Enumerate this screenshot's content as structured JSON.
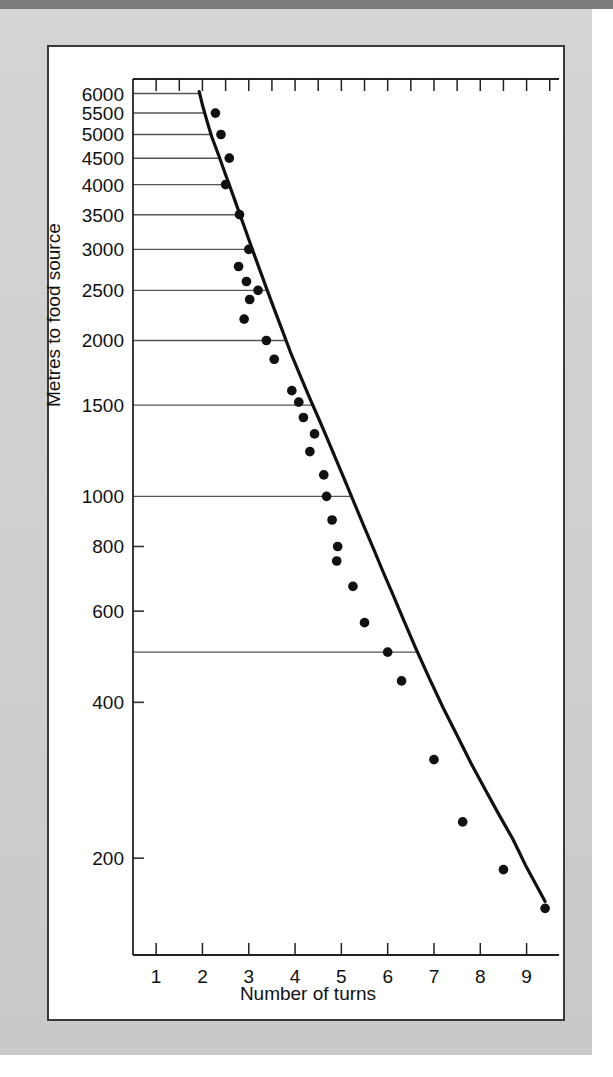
{
  "page": {
    "background": "#ffffff",
    "mat_color": "#d2d2d2",
    "top_band_color": "#7b7b7b",
    "frame_color": "#3a3a3a"
  },
  "figure": {
    "axis_title_y": "Metres to food source",
    "axis_title_x": "Number of turns"
  },
  "chart_data": {
    "type": "scatter",
    "title": "",
    "xlabel": "Number of turns",
    "ylabel": "Metres to food source",
    "xlim": [
      0.5,
      9.7
    ],
    "ylim": [
      130,
      6400
    ],
    "yscale": "log",
    "xscale": "linear",
    "grid": "horizontal-gridlines-terminating-at-fitted-curve",
    "legend": "none",
    "xticks": [
      1,
      2,
      3,
      4,
      5,
      6,
      7,
      8,
      9
    ],
    "xtick_labels": [
      "1",
      "2",
      "3",
      "4",
      "5",
      "6",
      "7",
      "8",
      "9"
    ],
    "yticks": [
      200,
      400,
      600,
      800,
      1000,
      1500,
      2000,
      2500,
      3000,
      3500,
      4000,
      4500,
      5000,
      5500,
      6000
    ],
    "ytick_labels": [
      "200",
      "400",
      "600",
      "800",
      "1000",
      "1500",
      "2000",
      "2500",
      "3000",
      "3500",
      "4000",
      "4500",
      "5000",
      "5500",
      "6000"
    ],
    "gridline_values": [
      500,
      1000,
      1500,
      2000,
      2500,
      3000,
      3500,
      4000,
      4500,
      5000,
      5500,
      6000
    ],
    "short_tick_values": [
      200,
      400,
      600,
      800
    ],
    "marker": {
      "shape": "circle",
      "color": "#111111",
      "size": 7
    },
    "curve": {
      "name": "fitted decay curve",
      "color": "#111111",
      "width": 3.2,
      "points": [
        [
          1.93,
          6050
        ],
        [
          2.0,
          5700
        ],
        [
          2.1,
          5300
        ],
        [
          2.2,
          4950
        ],
        [
          2.35,
          4560
        ],
        [
          2.5,
          4180
        ],
        [
          2.65,
          3840
        ],
        [
          2.8,
          3520
        ],
        [
          2.95,
          3230
        ],
        [
          3.1,
          2960
        ],
        [
          3.25,
          2720
        ],
        [
          3.4,
          2500
        ],
        [
          3.55,
          2300
        ],
        [
          3.7,
          2120
        ],
        [
          3.9,
          1900
        ],
        [
          4.1,
          1720
        ],
        [
          4.3,
          1560
        ],
        [
          4.5,
          1420
        ],
        [
          4.7,
          1290
        ],
        [
          4.9,
          1170
        ],
        [
          5.1,
          1060
        ],
        [
          5.3,
          960
        ],
        [
          5.5,
          870
        ],
        [
          5.7,
          790
        ],
        [
          5.9,
          715
        ],
        [
          6.1,
          650
        ],
        [
          6.35,
          575
        ],
        [
          6.6,
          510
        ],
        [
          6.9,
          445
        ],
        [
          7.2,
          390
        ],
        [
          7.5,
          345
        ],
        [
          7.8,
          305
        ],
        [
          8.1,
          272
        ],
        [
          8.4,
          243
        ],
        [
          8.7,
          218
        ],
        [
          9.0,
          192
        ],
        [
          9.4,
          165
        ]
      ]
    },
    "series": [
      {
        "name": "observations",
        "points": [
          [
            2.28,
            5500
          ],
          [
            2.4,
            5000
          ],
          [
            2.58,
            4500
          ],
          [
            2.5,
            4000
          ],
          [
            2.8,
            3500
          ],
          [
            3.0,
            3000
          ],
          [
            2.78,
            2780
          ],
          [
            2.95,
            2600
          ],
          [
            3.2,
            2500
          ],
          [
            3.02,
            2400
          ],
          [
            2.9,
            2200
          ],
          [
            3.38,
            2000
          ],
          [
            3.55,
            1840
          ],
          [
            3.93,
            1600
          ],
          [
            4.08,
            1520
          ],
          [
            4.18,
            1420
          ],
          [
            4.42,
            1320
          ],
          [
            4.32,
            1220
          ],
          [
            4.62,
            1100
          ],
          [
            4.68,
            1000
          ],
          [
            4.8,
            900
          ],
          [
            4.92,
            800
          ],
          [
            4.9,
            750
          ],
          [
            5.25,
            670
          ],
          [
            5.5,
            570
          ],
          [
            6.0,
            500
          ],
          [
            6.3,
            440
          ],
          [
            7.0,
            310
          ],
          [
            7.62,
            235
          ],
          [
            8.5,
            190
          ],
          [
            9.4,
            160
          ]
        ]
      }
    ]
  }
}
